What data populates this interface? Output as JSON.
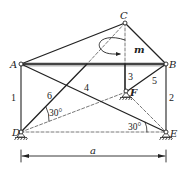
{
  "diagram": {
    "title": "",
    "nodes": {
      "A": {
        "label": "A",
        "x": 21,
        "y": 64
      },
      "B": {
        "label": "B",
        "x": 166,
        "y": 64
      },
      "C": {
        "label": "C",
        "x": 125,
        "y": 23
      },
      "D": {
        "label": "D",
        "x": 21,
        "y": 132
      },
      "E": {
        "label": "E",
        "x": 166,
        "y": 132
      },
      "F": {
        "label": "F",
        "x": 126,
        "y": 92
      }
    },
    "members": [
      {
        "id": "1",
        "label": "1"
      },
      {
        "id": "2",
        "label": "2"
      },
      {
        "id": "3",
        "label": "3"
      },
      {
        "id": "4",
        "label": "4"
      },
      {
        "id": "5",
        "label": "5"
      },
      {
        "id": "6",
        "label": "6"
      }
    ],
    "moment_label": "m",
    "angle_D": "30°",
    "angle_E": "30°",
    "dimension_label": "a",
    "colors": {
      "line": "#222222",
      "dashed": "#555555",
      "background": "#ffffff"
    }
  }
}
